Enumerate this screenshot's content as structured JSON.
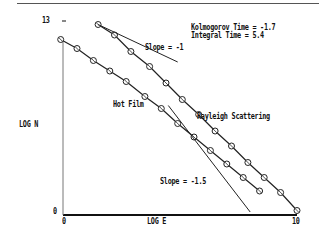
{
  "chart_data": {
    "type": "line",
    "title": "",
    "xlabel": "LOG E",
    "ylabel": "LOG N",
    "xlim": [
      0,
      10
    ],
    "ylim": [
      0,
      13
    ],
    "x_ticks": [
      "0",
      "10"
    ],
    "y_ticks": [
      "0",
      "13"
    ],
    "grid": false,
    "legend": "inline labels",
    "annotations": {
      "kolmogorov": "Kolmogorov Time = -1.7",
      "integral": "Integral Time = 5.4",
      "slope1": "Slope = -1",
      "slope15": "Slope = -1.5"
    },
    "series": [
      {
        "name": "Hot Film",
        "x": [
          -0.1,
          0.6,
          1.3,
          2.0,
          2.7,
          3.5,
          4.2,
          4.9,
          5.6,
          6.3,
          7.0,
          7.7,
          8.4
        ],
        "y": [
          11.7,
          11.1,
          10.3,
          9.6,
          8.9,
          7.9,
          7.1,
          6.1,
          5.2,
          4.3,
          3.4,
          2.5,
          1.6
        ]
      },
      {
        "name": "Rayleigh Scattering",
        "x": [
          1.5,
          2.2,
          2.9,
          3.7,
          4.4,
          5.1,
          5.8,
          6.5,
          7.2,
          7.9,
          8.6,
          9.3,
          10.0
        ],
        "y": [
          12.7,
          12.0,
          10.9,
          9.9,
          8.8,
          7.7,
          6.7,
          5.6,
          4.6,
          3.5,
          2.5,
          1.5,
          0.3
        ]
      },
      {
        "name": "Slope = -1 reference",
        "x": [
          1.5,
          4.9
        ],
        "y": [
          12.7,
          10.2
        ]
      },
      {
        "name": "Slope = -1.5 reference",
        "x": [
          4.5,
          8.0
        ],
        "y": [
          7.3,
          0.2
        ]
      }
    ]
  },
  "labels": {
    "y_top": "13",
    "y_bottom": "0",
    "x_left": "0",
    "x_right": "10",
    "xlabel": "LOG E",
    "ylabel": "LOG N",
    "kolmogorov": "Kolmogorov Time = -1.7",
    "integral": "Integral Time = 5.4",
    "slope1": "Slope = -1",
    "slope15": "Slope = -1.5",
    "hotfilm": "Hot Film",
    "rayleigh": "Rayleigh Scattering"
  }
}
